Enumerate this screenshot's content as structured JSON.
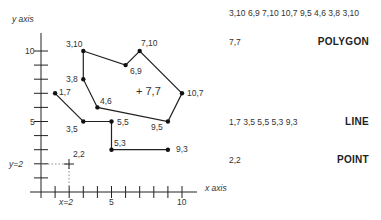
{
  "axes": {
    "x_label": "x axis",
    "y_label": "y axis",
    "x_ticks": [
      "5",
      "10"
    ],
    "y_ticks": [
      "5",
      "10"
    ],
    "x_marker_label": "x=2",
    "y_marker_label": "y=2"
  },
  "colors": {
    "line": "#222222",
    "dotted": "#888888",
    "text": "#333333"
  },
  "polygon": {
    "vertices": [
      [
        3,
        10
      ],
      [
        6,
        9
      ],
      [
        7,
        10
      ],
      [
        10,
        7
      ],
      [
        9,
        5
      ],
      [
        4,
        6
      ],
      [
        3,
        8
      ],
      [
        3,
        10
      ]
    ],
    "labels": [
      "3,10",
      "6,9",
      "7,10",
      "10,7",
      "9,5",
      "4,6",
      "3,8"
    ],
    "centroid": [
      7,
      7
    ],
    "centroid_label": "+ 7,7"
  },
  "line": {
    "vertices": [
      [
        1,
        7
      ],
      [
        3,
        5
      ],
      [
        5,
        5
      ],
      [
        5,
        3
      ],
      [
        9,
        3
      ]
    ],
    "labels": [
      "1,7",
      "3,5",
      "5,5",
      "5,3",
      "9,3"
    ]
  },
  "point": {
    "coords": [
      2,
      2
    ],
    "label": "2,2"
  },
  "legend": {
    "polygon": {
      "coords": "3,10 6,9 7,10 10,7 9,5 4,6 3,8 3,10",
      "centroid": "7,7",
      "type": "POLYGON"
    },
    "line": {
      "coords": "1,7 3,5 5,5 5,3 9,3",
      "type": "LINE"
    },
    "point": {
      "coords": "2,2",
      "type": "POINT"
    }
  }
}
